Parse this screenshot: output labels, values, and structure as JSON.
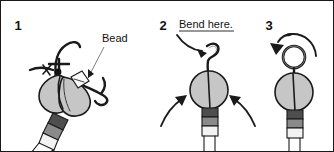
{
  "figure": {
    "background_color": "#ffffff",
    "border_color": "#1a1a1a",
    "width": 334,
    "height": 152,
    "ink_color": "#1a1a1a",
    "body_fill_color": "#c6c6c6",
    "segment_dark_color": "#4e4e4e",
    "segment_mid_color": "#8a8a8a",
    "segment_light_color": "#f2f2f2"
  },
  "panels": [
    {
      "number": "1",
      "label": "Bead",
      "description": "Hook with bead threaded on, held at an angle with striped body"
    },
    {
      "number": "2",
      "label": "Bend here.",
      "description": "Upright lure with S-shaped wire above body, two curved arrows pointing inward"
    },
    {
      "number": "3",
      "label": "",
      "description": "Upright lure with closed ring loop formed at the top, curved arrow showing rotation"
    }
  ]
}
